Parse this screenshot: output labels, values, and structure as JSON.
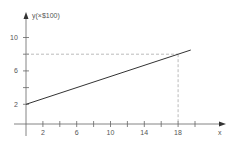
{
  "chart_data": {
    "type": "line",
    "title": "",
    "xlabel": "x",
    "ylabel": "y(×$100)",
    "x_ticks": [
      2,
      4,
      6,
      8,
      10,
      12,
      14,
      16,
      18,
      20
    ],
    "x_tick_labels": [
      "2",
      "6",
      "10",
      "14",
      "18"
    ],
    "y_ticks": [
      2,
      4,
      6,
      8,
      10
    ],
    "y_tick_labels": [
      "2",
      "6",
      "10"
    ],
    "xlim": [
      0,
      22
    ],
    "ylim": [
      0,
      11
    ],
    "grid": false,
    "series": [
      {
        "name": "y",
        "x": [
          0,
          19.5
        ],
        "y": [
          2,
          8.5
        ]
      }
    ],
    "annotations": [
      {
        "type": "dashed-guide",
        "point": [
          18,
          8
        ]
      }
    ]
  },
  "colors": {
    "line": "#333333",
    "axis": "#666666",
    "dashed": "#aaaaaa",
    "text": "#555555"
  }
}
